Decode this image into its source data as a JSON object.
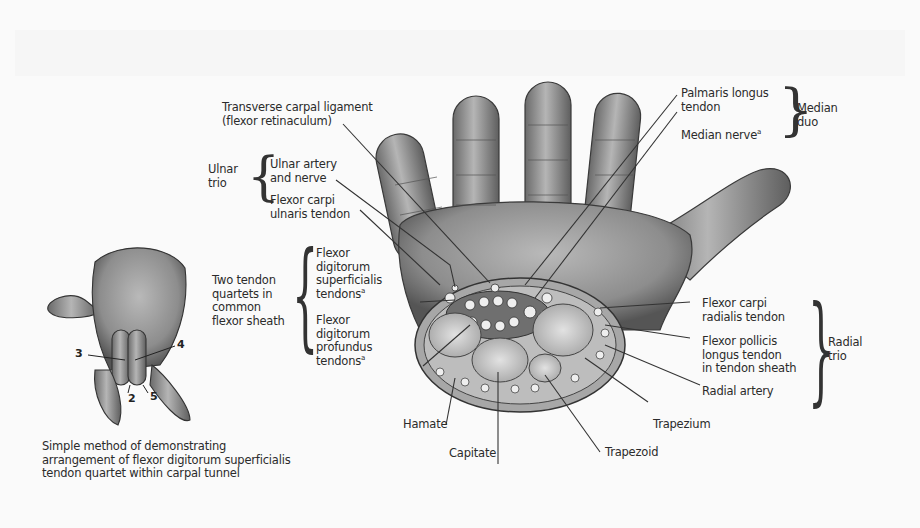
{
  "figure": {
    "colors": {
      "background": "#fafafa",
      "text": "#2b2b2b",
      "skin_shade": "#8a8a8a",
      "leader_line": "#333333"
    }
  },
  "labels": {
    "transverse_ligament": {
      "line1": "Transverse carpal ligament",
      "line2": "(flexor retinaculum)"
    },
    "ulnar_trio": {
      "group": {
        "line1": "Ulnar",
        "line2": "trio"
      },
      "ulnar_artery_nerve": {
        "line1": "Ulnar artery",
        "line2": "and nerve"
      },
      "fcu": {
        "line1": "Flexor carpi",
        "line2": "ulnaris tendon"
      }
    },
    "tendon_quartets": {
      "group": {
        "line1": "Two tendon",
        "line2": "quartets in",
        "line3": "common",
        "line4": "flexor sheath"
      },
      "fds": {
        "line1": "Flexor",
        "line2": "digitorum",
        "line3": "superficialis",
        "line4": "tendons",
        "sup": "a"
      },
      "fdp": {
        "line1": "Flexor",
        "line2": "digitorum",
        "line3": "profundus",
        "line4": "tendons",
        "sup": "a"
      }
    },
    "median_duo": {
      "group": {
        "line1": "Median",
        "line2": "duo"
      },
      "palmaris": {
        "line1": "Palmaris longus",
        "line2": "tendon"
      },
      "median_nerve": {
        "line1": "Median nerve",
        "sup": "a"
      }
    },
    "radial_trio": {
      "group": {
        "line1": "Radial",
        "line2": "trio"
      },
      "fcr": {
        "line1": "Flexor carpi",
        "line2": "radialis tendon"
      },
      "fpl": {
        "line1": "Flexor pollicis",
        "line2": "longus tendon",
        "line3": "in tendon sheath"
      },
      "radial_artery": {
        "line1": "Radial artery"
      }
    },
    "bones": {
      "hamate": "Hamate",
      "capitate": "Capitate",
      "trapezoid": "Trapezoid",
      "trapezium": "Trapezium"
    },
    "small_hand_numbers": {
      "n2": "2",
      "n3": "3",
      "n4": "4",
      "n5": "5"
    },
    "caption": {
      "line1": "Simple method of demonstrating",
      "line2": "arrangement of flexor digitorum superficialis",
      "line3": "tendon quartet within carpal tunnel"
    }
  }
}
